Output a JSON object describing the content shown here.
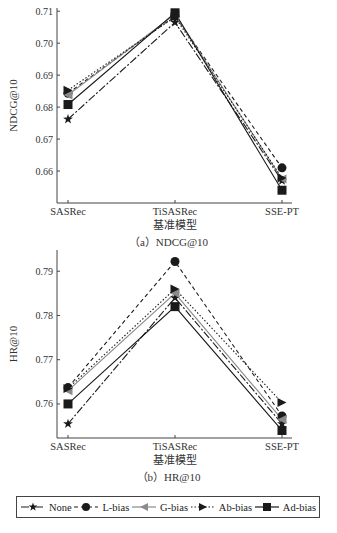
{
  "chart_data": [
    {
      "type": "line",
      "title": "",
      "caption": "（a）NDCG@10",
      "xlabel": "基准模型",
      "ylabel": "NDCG@10",
      "categories": [
        "SASRec",
        "TiSASRec",
        "SSE-PT"
      ],
      "yticks": [
        0.66,
        0.67,
        0.68,
        0.69,
        0.7,
        0.71
      ],
      "ytick_labels": [
        "0.66",
        "0.67",
        "0.68",
        "0.69",
        "0.70",
        "0.71"
      ],
      "ylim": [
        0.65,
        0.711
      ],
      "grid": false,
      "series": [
        {
          "name": "None",
          "values": [
            0.6762,
            0.7065,
            0.657
          ]
        },
        {
          "name": "L-bias",
          "values": [
            0.6843,
            0.7085,
            0.661
          ]
        },
        {
          "name": "G-bias",
          "values": [
            0.6838,
            0.709,
            0.6575
          ]
        },
        {
          "name": "Ab-bias",
          "values": [
            0.6853,
            0.7082,
            0.6578
          ]
        },
        {
          "name": "Ad-bias",
          "values": [
            0.6808,
            0.7095,
            0.654
          ]
        }
      ]
    },
    {
      "type": "line",
      "title": "",
      "caption": "（b）HR@10",
      "xlabel": "基准模型",
      "ylabel": "HR@10",
      "categories": [
        "SASRec",
        "TiSASRec",
        "SSE-PT"
      ],
      "yticks": [
        0.76,
        0.77,
        0.78,
        0.79
      ],
      "ytick_labels": [
        "0.76",
        "0.77",
        "0.78",
        "0.79"
      ],
      "ylim": [
        0.7523,
        0.7948
      ],
      "grid": false,
      "series": [
        {
          "name": "None",
          "values": [
            0.7555,
            0.784,
            0.7555
          ]
        },
        {
          "name": "L-bias",
          "values": [
            0.7637,
            0.7922,
            0.7573
          ]
        },
        {
          "name": "G-bias",
          "values": [
            0.763,
            0.785,
            0.7565
          ]
        },
        {
          "name": "Ab-bias",
          "values": [
            0.7635,
            0.786,
            0.7603
          ]
        },
        {
          "name": "Ad-bias",
          "values": [
            0.76,
            0.782,
            0.754
          ]
        }
      ]
    }
  ],
  "legend": {
    "position": "bottom",
    "items": [
      {
        "name": "None",
        "marker": "star",
        "dash": "8,2,2,2",
        "color": "#1a1a1a"
      },
      {
        "name": "L-bias",
        "marker": "circle",
        "dash": "4,3",
        "color": "#1a1a1a"
      },
      {
        "name": "G-bias",
        "marker": "triangle-left",
        "dash": "",
        "color": "#8a8a8a"
      },
      {
        "name": "Ab-bias",
        "marker": "triangle-right",
        "dash": "1.5,2",
        "color": "#1a1a1a"
      },
      {
        "name": "Ad-bias",
        "marker": "square",
        "dash": "",
        "color": "#1a1a1a"
      }
    ]
  }
}
